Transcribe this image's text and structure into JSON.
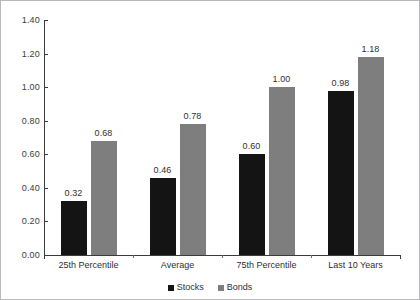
{
  "chart_data": {
    "type": "bar",
    "title": "",
    "subtitle": "",
    "xlabel": "",
    "ylabel": "",
    "categories": [
      "25th Percentile",
      "Average",
      "75th Percentile",
      "Last 10 Years"
    ],
    "series": [
      {
        "name": "Stocks",
        "color": "#141414",
        "values": [
          0.32,
          0.46,
          0.6,
          0.98
        ]
      },
      {
        "name": "Bonds",
        "color": "#7e7e7e",
        "values": [
          0.68,
          0.78,
          1.0,
          1.18
        ]
      }
    ],
    "value_labels": {
      "Stocks": [
        "0.32",
        "0.46",
        "0.60",
        "0.98"
      ],
      "Bonds": [
        "0.68",
        "0.78",
        "1.00",
        "1.18"
      ]
    },
    "ylim": [
      0.0,
      1.4
    ],
    "ytick_values": [
      0.0,
      0.2,
      0.4,
      0.6,
      0.8,
      1.0,
      1.2,
      1.4
    ],
    "ytick_labels": [
      "0.00",
      "0.20",
      "0.40",
      "0.60",
      "0.80",
      "1.00",
      "1.20",
      "1.40"
    ],
    "grid": false,
    "legend_position": "bottom-center",
    "data_labels_shown": true
  },
  "axis": {
    "y": {
      "ticks": [
        {
          "label": "1.40"
        },
        {
          "label": "1.20"
        },
        {
          "label": "1.00"
        },
        {
          "label": "0.80"
        },
        {
          "label": "0.60"
        },
        {
          "label": "0.40"
        },
        {
          "label": "0.20"
        },
        {
          "label": "0.00"
        }
      ]
    },
    "x": {
      "categories": [
        {
          "label": "25th Percentile"
        },
        {
          "label": "Average"
        },
        {
          "label": "75th Percentile"
        },
        {
          "label": "Last 10 Years"
        }
      ]
    }
  },
  "bars": [
    {
      "group": "25th Percentile",
      "series": "Stocks",
      "value_label": "0.32"
    },
    {
      "group": "25th Percentile",
      "series": "Bonds",
      "value_label": "0.68"
    },
    {
      "group": "Average",
      "series": "Stocks",
      "value_label": "0.46"
    },
    {
      "group": "Average",
      "series": "Bonds",
      "value_label": "0.78"
    },
    {
      "group": "75th Percentile",
      "series": "Stocks",
      "value_label": "0.60"
    },
    {
      "group": "75th Percentile",
      "series": "Bonds",
      "value_label": "1.00"
    },
    {
      "group": "Last 10 Years",
      "series": "Stocks",
      "value_label": "0.98"
    },
    {
      "group": "Last 10 Years",
      "series": "Bonds",
      "value_label": "1.18"
    }
  ],
  "legend": {
    "items": [
      {
        "label": "Stocks",
        "color": "#141414"
      },
      {
        "label": "Bonds",
        "color": "#7e7e7e"
      }
    ]
  },
  "colors": {
    "stocks": "#141414",
    "bonds": "#7e7e7e",
    "axis": "#3b3b3b",
    "text": "#2f2f2f",
    "frame": "#b9b9bb",
    "background": "#ffffff"
  }
}
